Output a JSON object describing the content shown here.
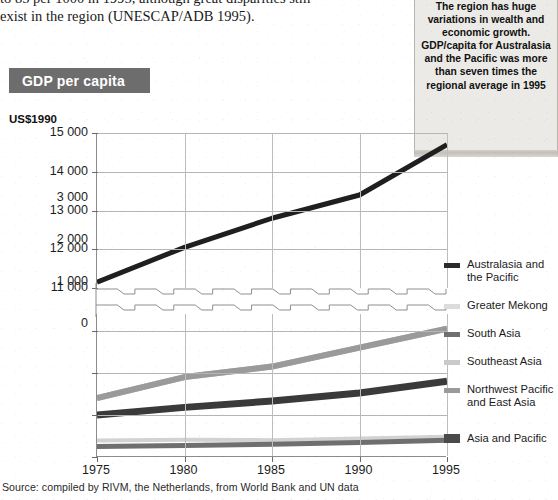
{
  "body_copy": {
    "line1": "to 85 per 1000 in 1995, although great disparities still",
    "line2": "exist in the region (UNESCAP/ADB 1995)."
  },
  "callout": {
    "text": "The region has huge variations in wealth and economic growth. GDP/capita for Australasia and the Pacific was more than seven times the regional average in 1995"
  },
  "source": {
    "text": "Source: compiled by RIVM, the Netherlands, from World Bank and UN data"
  },
  "chart_data": {
    "type": "line",
    "title": "GDP per capita",
    "ylabel": "US$1990",
    "xlabel": "",
    "x": [
      1975,
      1980,
      1985,
      1990,
      1995
    ],
    "xticklabels": [
      "1975",
      "1980",
      "1985",
      "1990",
      "1995"
    ],
    "xlim": [
      1975,
      1995
    ],
    "broken_axis": true,
    "axis_break_note": "y-axis broken between 3 000 and 11 000",
    "upper_panel": {
      "ylim": [
        11000,
        15000
      ],
      "yticklabels": [
        "15 000",
        "14 000",
        "13 000",
        "12 000",
        "11 000"
      ],
      "yticks": [
        15000,
        14000,
        13000,
        12000,
        11000
      ]
    },
    "lower_panel": {
      "ylim": [
        0,
        3400
      ],
      "yticklabels": [
        "3 000",
        "2 000",
        "1 000",
        "0"
      ],
      "yticks": [
        3000,
        2000,
        1000,
        0
      ]
    },
    "grid": true,
    "legend_position": "right",
    "series": [
      {
        "name": "Australasia and the Pacific",
        "panel": "upper",
        "color": "#1f1f1f",
        "width": 5,
        "values": [
          11150,
          12050,
          12800,
          13400,
          14700
        ]
      },
      {
        "name": "Greater Mekong",
        "panel": "lower",
        "color": "#d2d2d2",
        "width": 4,
        "values": [
          390,
          410,
          400,
          440,
          480
        ]
      },
      {
        "name": "South Asia",
        "panel": "lower",
        "color": "#6f6f6f",
        "width": 5,
        "values": [
          250,
          275,
          305,
          345,
          400
        ]
      },
      {
        "name": "Southeast Asia",
        "panel": "lower",
        "color": "#bcbcbc",
        "width": 6,
        "values": [
          1400,
          1900,
          2150,
          2600,
          3050
        ]
      },
      {
        "name": "Northwest Pacific and East Asia",
        "panel": "lower",
        "color": "#9a9a9a",
        "width": 6,
        "values": [
          1400,
          1900,
          2150,
          2600,
          3050
        ]
      },
      {
        "name": "Asia and Pacific",
        "panel": "lower",
        "color": "#3a3a3a",
        "width": 7,
        "values": [
          1000,
          1180,
          1330,
          1520,
          1800
        ]
      }
    ],
    "legend": [
      {
        "label_line1": "Australasia and",
        "label_line2": "the Pacific",
        "color": "#2b2b2b"
      },
      {
        "label_line1": "Greater Mekong",
        "label_line2": "",
        "color": "#dcdcdc"
      },
      {
        "label_line1": "South Asia",
        "label_line2": "",
        "color": "#6f6f6f"
      },
      {
        "label_line1": "Southeast Asia",
        "label_line2": "",
        "color": "#c9c9c9"
      },
      {
        "label_line1": "Northwest Pacific",
        "label_line2": "and East Asia",
        "color": "#9a9a9a"
      },
      {
        "label_line1": "Asia and Pacific",
        "label_line2": "",
        "color": "#4a4a4a"
      }
    ]
  }
}
